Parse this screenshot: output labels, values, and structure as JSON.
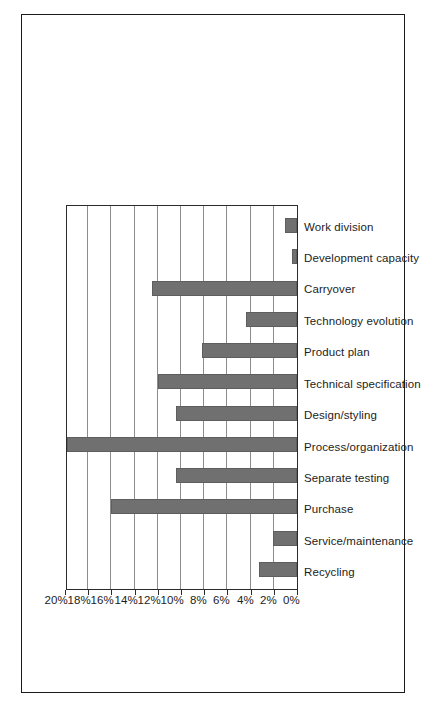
{
  "page": {
    "border_color": "#1a1a1a",
    "background": "#ffffff"
  },
  "chart_data": {
    "type": "bar",
    "title": "",
    "subtitle": "",
    "xlabel": "",
    "ylabel": "",
    "orientation": "vertical-rotated-90ccw",
    "grid": true,
    "legend": null,
    "bar_color": "#707070",
    "axis_color": "#2b2b2b",
    "gridline_color": "#8d8d8d",
    "ylim": [
      0,
      20
    ],
    "ytick_step": 2,
    "value_unit": "%",
    "ytick_labels": [
      "0%",
      "2%",
      "4%",
      "6%",
      "8%",
      "10%",
      "12%",
      "14%",
      "16%",
      "18%",
      "20%"
    ],
    "ytick_values": [
      0,
      2,
      4,
      6,
      8,
      10,
      12,
      14,
      16,
      18,
      20
    ],
    "categories": [
      "Recycling",
      "Service/maintenance",
      "Purchase",
      "Separate testing",
      "Process/organization",
      "Design/styling",
      "Technical specification",
      "Product plan",
      "Technology evolution",
      "Carryover",
      "Development capacity",
      "Work division"
    ],
    "values": [
      3.3,
      2.1,
      16.0,
      10.4,
      19.8,
      10.4,
      12.0,
      8.2,
      4.4,
      12.5,
      0.4,
      1.0
    ]
  }
}
